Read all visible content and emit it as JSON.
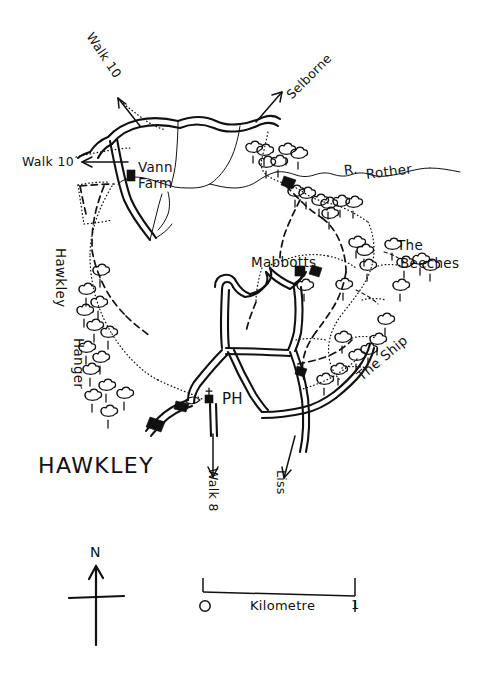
{
  "map": {
    "title": "HAWKLEY",
    "background_color": "#ffffff",
    "ink_color": "#111111",
    "style": "hand-drawn line map",
    "places": [
      {
        "id": "vann-farm",
        "label": "Vann\nFarm",
        "label_line1": "Vann",
        "label_line2": "Farm",
        "x": 137,
        "y": 165
      },
      {
        "id": "mabbotts",
        "label": "Mabbotts",
        "x": 253,
        "y": 257
      },
      {
        "id": "the-beeches",
        "label_line1": "The",
        "label_line2": "Beeches",
        "x": 397,
        "y": 240
      },
      {
        "id": "the-ship",
        "label": "The Ship",
        "x": 355,
        "y": 368,
        "rotation": -40
      },
      {
        "id": "hawkley-hanger",
        "label_line1": "Hawkley",
        "label_line2": "Hanger",
        "x": 56,
        "y": 258,
        "rotation": 90
      }
    ],
    "features": [
      {
        "id": "r-rother",
        "label": "R. Rother",
        "label_part1": "R.",
        "label_part2": "Rother",
        "x": 344,
        "y": 170,
        "rotation": -8,
        "kind": "river"
      },
      {
        "id": "ph",
        "label": "PH",
        "x": 226,
        "y": 400,
        "kind": "public-house"
      }
    ],
    "direction_arrows": [
      {
        "id": "walk-10-nw",
        "label": "Walk 10",
        "x": 93,
        "y": 35,
        "rotation": 56,
        "points_to": "north-west"
      },
      {
        "id": "walk-10-west",
        "label": "Walk 10",
        "x": 24,
        "y": 160,
        "rotation": 0,
        "points_to": "west"
      },
      {
        "id": "selborne",
        "label": "Selborne",
        "x": 281,
        "y": 90,
        "rotation": -45,
        "points_to": "north-east"
      },
      {
        "id": "walk-8",
        "label": "Walk 8",
        "x": 213,
        "y": 465,
        "rotation": 90,
        "points_to": "south"
      },
      {
        "id": "liss",
        "label": "Liss",
        "x": 281,
        "y": 470,
        "rotation": 90,
        "points_to": "south"
      }
    ],
    "compass": {
      "label": "N",
      "x": 96,
      "y": 547
    },
    "scale_bar": {
      "unit_label": "Kilometre",
      "min_label": "0",
      "max_label": "1",
      "x": 200,
      "y": 580,
      "length_px": 152
    }
  }
}
